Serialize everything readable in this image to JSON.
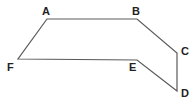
{
  "diagram": {
    "type": "polygon",
    "stroke_color": "#5a5a5a",
    "vertices": [
      {
        "name": "A",
        "x": 47,
        "y": 19,
        "label_x": 42,
        "label_y": 15
      },
      {
        "name": "B",
        "x": 137,
        "y": 19,
        "label_x": 132,
        "label_y": 15
      },
      {
        "name": "C",
        "x": 177,
        "y": 53,
        "label_x": 181,
        "label_y": 55
      },
      {
        "name": "D",
        "x": 177,
        "y": 91,
        "label_x": 181,
        "label_y": 97
      },
      {
        "name": "E",
        "x": 137,
        "y": 60,
        "label_x": 129,
        "label_y": 71
      },
      {
        "name": "F",
        "x": 18,
        "y": 59,
        "label_x": 7,
        "label_y": 71
      }
    ],
    "labels": {
      "A": "A",
      "B": "B",
      "C": "C",
      "D": "D",
      "E": "E",
      "F": "F"
    }
  }
}
